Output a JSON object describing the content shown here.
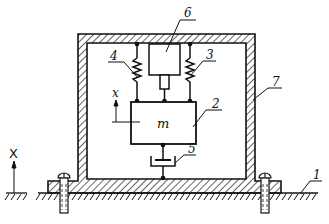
{
  "diagram": {
    "type": "mechanical schematic (seismic mass vibration sensor in housing)",
    "labels": {
      "ground": "1",
      "mass_block": "2",
      "spring_right": "3",
      "spring_left": "4",
      "damper_bottom": "5",
      "transducer_top": "6",
      "housing": "7",
      "mass_symbol": "m",
      "relative_coord": "x",
      "absolute_coord": "X"
    },
    "colors": {
      "line": "#111111",
      "background": "#ffffff"
    }
  }
}
